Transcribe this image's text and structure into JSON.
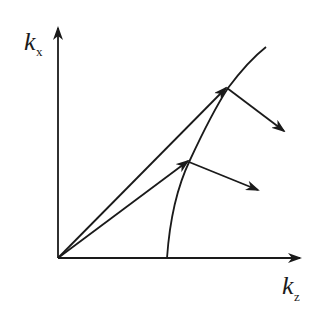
{
  "diagram": {
    "axes": {
      "vertical": {
        "symbol": "k",
        "subscript": "x"
      },
      "horizontal": {
        "symbol": "k",
        "subscript": "z"
      }
    },
    "elements": [
      {
        "type": "curve",
        "name": "dispersion-curve"
      },
      {
        "type": "arrow",
        "name": "wave-vector-upper"
      },
      {
        "type": "arrow",
        "name": "wave-vector-lower"
      },
      {
        "type": "arrow",
        "name": "normal-arrow-upper"
      },
      {
        "type": "arrow",
        "name": "normal-arrow-lower"
      }
    ],
    "color": "#1a1a1a"
  }
}
